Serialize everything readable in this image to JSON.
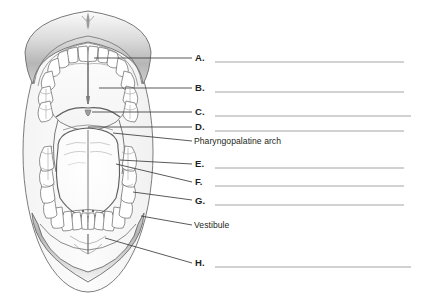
{
  "figure": {
    "view": "anterior view of open mouth",
    "structures": [
      "upper lip",
      "hard palate",
      "palatine rugae",
      "median palatine raphe",
      "upper teeth",
      "uvula",
      "soft palate",
      "glossopalatine arch",
      "pharyngopalatine arch",
      "palatine tonsil",
      "tongue",
      "median sulcus of tongue",
      "lower teeth",
      "gingiva",
      "lingual frenulum",
      "vestibule",
      "lower lip"
    ],
    "colors": {
      "outline": "#5a5a5a",
      "lip_fill_light": "#f2f2f2",
      "lip_fill_dark": "#b9b9b9",
      "tongue_fill": "#fdfdfd",
      "leader_line": "#3c3c3c",
      "answer_rule": "#8d8d8d",
      "text": "#231f20"
    }
  },
  "callouts": [
    {
      "key": "A",
      "label": "A.",
      "answer": "",
      "type": "blank"
    },
    {
      "key": "B",
      "label": "B.",
      "answer": "",
      "type": "blank"
    },
    {
      "key": "C",
      "label": "C.",
      "answer": "",
      "type": "blank"
    },
    {
      "key": "D",
      "label": "D.",
      "answer": "",
      "type": "blank"
    },
    {
      "key": "pharyngopalatine",
      "label": "Pharyngopalatine arch",
      "answer": "Pharyngopalatine arch",
      "type": "given"
    },
    {
      "key": "E",
      "label": "E.",
      "answer": "",
      "type": "blank"
    },
    {
      "key": "F",
      "label": "F.",
      "answer": "",
      "type": "blank"
    },
    {
      "key": "G",
      "label": "G.",
      "answer": "",
      "type": "blank"
    },
    {
      "key": "vestibule",
      "label": "Vestibule",
      "answer": "Vestibule",
      "type": "given"
    },
    {
      "key": "H",
      "label": "H.",
      "answer": "",
      "type": "blank"
    }
  ]
}
